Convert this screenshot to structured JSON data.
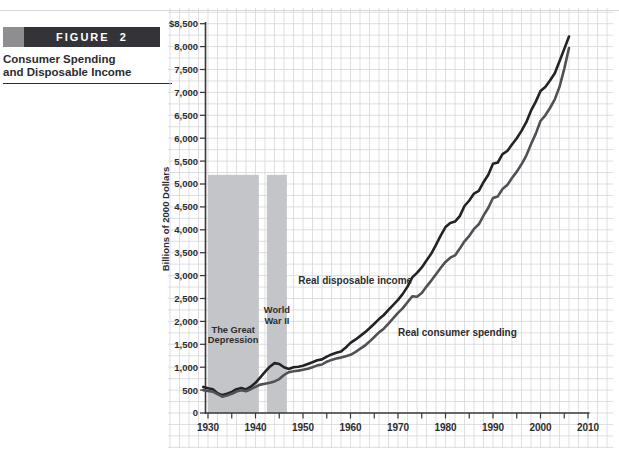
{
  "figure": {
    "label": "FIGURE  2",
    "caption_line1": "Consumer Spending",
    "caption_line2": "and Disposable Income"
  },
  "chart_data": {
    "type": "line",
    "title": "",
    "xlabel": "",
    "ylabel": "Billions of 2000 Dollars",
    "x_start_year": 1929,
    "x_end_year": 2006,
    "xlim": [
      1929,
      2010
    ],
    "ylim": [
      0,
      8500
    ],
    "grid": "fine graph-paper grid, about 2 years by $250 per cell",
    "legend_position": "inline annotations on lines",
    "xtick_major": [
      1930,
      1940,
      1950,
      1960,
      1970,
      1980,
      1990,
      2000,
      2010
    ],
    "xtick_minor_step": 5,
    "ytick_values": [
      8500,
      8000,
      7500,
      7000,
      6500,
      6000,
      5500,
      5000,
      4500,
      4000,
      3500,
      3000,
      2500,
      2000,
      1500,
      1000,
      500,
      0
    ],
    "ytick_labels": [
      "$8,500",
      "8,000",
      "7,500",
      "7,000",
      "6,500",
      "6,000",
      "5,500",
      "5,000",
      "4,500",
      "4,000",
      "3,500",
      "3,000",
      "2,500",
      "2,000",
      "1,500",
      "1,000",
      "500",
      "0"
    ],
    "series": [
      {
        "name": "Real disposable income",
        "color": "#232326",
        "values": [
          570,
          540,
          520,
          430,
          390,
          420,
          460,
          520,
          545,
          515,
          575,
          660,
          780,
          900,
          1010,
          1090,
          1070,
          1000,
          960,
          1000,
          1010,
          1030,
          1070,
          1110,
          1150,
          1170,
          1230,
          1280,
          1315,
          1340,
          1430,
          1530,
          1600,
          1680,
          1760,
          1850,
          1950,
          2050,
          2140,
          2250,
          2360,
          2470,
          2600,
          2760,
          2960,
          3060,
          3180,
          3330,
          3480,
          3670,
          3880,
          4060,
          4150,
          4180,
          4300,
          4520,
          4640,
          4790,
          4850,
          5040,
          5200,
          5440,
          5470,
          5650,
          5720,
          5860,
          6000,
          6160,
          6350,
          6600,
          6800,
          7030,
          7120,
          7260,
          7420,
          7680,
          7950,
          8220
        ]
      },
      {
        "name": "Real consumer spending",
        "color": "#515155",
        "values": [
          500,
          480,
          465,
          410,
          355,
          385,
          420,
          470,
          495,
          475,
          520,
          570,
          620,
          640,
          660,
          690,
          740,
          830,
          890,
          910,
          925,
          945,
          965,
          1000,
          1040,
          1060,
          1120,
          1160,
          1190,
          1210,
          1240,
          1270,
          1330,
          1400,
          1470,
          1560,
          1660,
          1760,
          1840,
          1950,
          2070,
          2185,
          2290,
          2420,
          2550,
          2540,
          2620,
          2760,
          2890,
          3030,
          3170,
          3300,
          3390,
          3440,
          3590,
          3750,
          3870,
          4020,
          4120,
          4310,
          4480,
          4695,
          4730,
          4890,
          4980,
          5130,
          5270,
          5430,
          5620,
          5870,
          6100,
          6375,
          6500,
          6660,
          6850,
          7120,
          7520,
          7970
        ]
      }
    ],
    "bands": [
      {
        "name": "The Great Depression",
        "label_lines": [
          "The Great",
          "Depression"
        ],
        "from_year": 1930,
        "to_year": 1940.7,
        "top_value": 5200,
        "label_year": 1935.3,
        "label_values": [
          1810,
          1590
        ]
      },
      {
        "name": "World War II",
        "label_lines": [
          "World",
          "War II"
        ],
        "from_year": 1942.4,
        "to_year": 1946.6,
        "top_value": 5200,
        "label_year": 1944.5,
        "label_values": [
          2250,
          2010
        ]
      }
    ],
    "annotations": [
      {
        "text": "Real disposable income",
        "year": 1949,
        "value": 2900,
        "anchor": "start"
      },
      {
        "text": "Real consumer spending",
        "year": 1982.5,
        "value": 1760,
        "anchor": "middle"
      }
    ],
    "colors": {
      "grid": "#d6d7d9",
      "band": "#c4c5c8",
      "axis": "#38383b",
      "text": "#2d2d30",
      "background": "#ffffff"
    },
    "map": {
      "x_at_1930": 208,
      "px_per_year": 4.75,
      "y_at_zero": 413,
      "px_per_unit": 0.0458,
      "grid_box": {
        "x0": 168,
        "x1": 613,
        "y0": 8,
        "y1": 448,
        "dx": 9.5,
        "dy": 11.45
      }
    }
  }
}
